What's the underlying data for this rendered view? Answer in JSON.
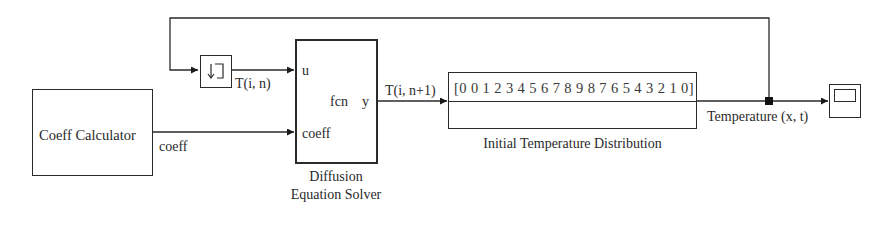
{
  "diagram": {
    "blocks": {
      "coeff_calculator": {
        "label": "Coeff Calculator"
      },
      "unit_delay": {
        "icon": "unit-delay-icon"
      },
      "solver": {
        "inner_label": "fcn",
        "input_u": "u",
        "input_coeff": "coeff",
        "output_y": "y",
        "caption_line1": "Diffusion",
        "caption_line2": "Equation Solver"
      },
      "initial_temp": {
        "value": "[0 0 1 2 3 4 5 6 7 8 9 8 7 6 5 4 3 2 1 0]",
        "caption": "Initial Temperature Distribution"
      },
      "scope": {
        "icon": "scope-icon"
      }
    },
    "signals": {
      "t_in": "T(i, n)",
      "coeff": "coeff",
      "t_next": "T(i, n+1)",
      "temperature": "Temperature (x, t)"
    }
  }
}
